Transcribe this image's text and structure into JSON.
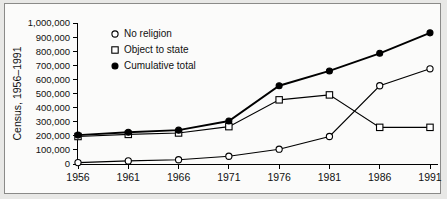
{
  "chart_data": {
    "type": "line",
    "title": "",
    "xlabel": "",
    "ylabel": "Census, 1956–1991",
    "categories": [
      "1956",
      "1961",
      "1966",
      "1971",
      "1976",
      "1981",
      "1986",
      "1991"
    ],
    "x": [
      1956,
      1961,
      1966,
      1971,
      1976,
      1981,
      1986,
      1991
    ],
    "ylim": [
      0,
      1000000
    ],
    "xlim": [
      1956,
      1991
    ],
    "grid": false,
    "legend_position": "top-left",
    "ytick_labels": [
      "0",
      "100,000",
      "200,000",
      "300,000",
      "400,000",
      "500,000",
      "600,000",
      "700,000",
      "800,000",
      "900,000",
      "1,000,000"
    ],
    "ytick_values": [
      0,
      100000,
      200000,
      300000,
      400000,
      500000,
      600000,
      700000,
      800000,
      900000,
      1000000
    ],
    "series": [
      {
        "name": "No religion",
        "marker": "open-circle",
        "line_weight": "thin",
        "values": [
          10000,
          22000,
          30000,
          55000,
          105000,
          195000,
          555000,
          675000
        ]
      },
      {
        "name": "Object to state",
        "marker": "open-square",
        "line_weight": "thin",
        "values": [
          195000,
          210000,
          220000,
          265000,
          455000,
          490000,
          260000,
          260000
        ]
      },
      {
        "name": "Cumulative total",
        "marker": "filled-circle",
        "line_weight": "thick",
        "values": [
          205000,
          225000,
          240000,
          305000,
          555000,
          660000,
          785000,
          930000
        ]
      }
    ]
  },
  "legend": {
    "items": [
      {
        "label": "No religion",
        "marker": "open-circle"
      },
      {
        "label": "Object to state",
        "marker": "open-square"
      },
      {
        "label": "Cumulative total",
        "marker": "filled-circle"
      }
    ]
  },
  "colors": {
    "ink": "#000000",
    "frame_border": "#8a8a88",
    "page_background": "#e8e8e6",
    "plot_background": "#fbfbfa"
  }
}
